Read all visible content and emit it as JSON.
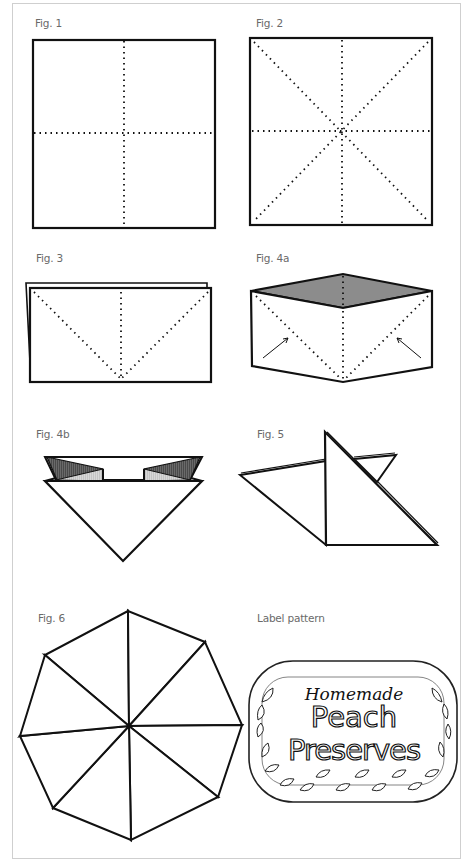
{
  "figures": {
    "fig1": {
      "label": "Fig. 1"
    },
    "fig2": {
      "label": "Fig. 2"
    },
    "fig3": {
      "label": "Fig. 3"
    },
    "fig4a": {
      "label": "Fig. 4a"
    },
    "fig4b": {
      "label": "Fig. 4b"
    },
    "fig5": {
      "label": "Fig. 5"
    },
    "fig6": {
      "label": "Fig. 6"
    }
  },
  "label_pattern": {
    "heading": "Label pattern",
    "line1": "Homemade",
    "line2": "Peach",
    "line3": "Preserves"
  },
  "colors": {
    "line": "#111111",
    "dark_fill": "#555555",
    "mid_fill": "#8a8a8a",
    "light_fill": "#cccccc",
    "frame": "#cfcfcf",
    "caption": "#6a6a6a"
  }
}
